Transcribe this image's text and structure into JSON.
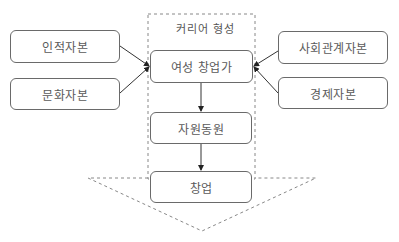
{
  "diagram": {
    "container": {
      "title": "커리어 형성"
    },
    "left_nodes": [
      {
        "label": "인적자본"
      },
      {
        "label": "문화자본"
      }
    ],
    "center_nodes": [
      {
        "label": "여성 창업가"
      },
      {
        "label": "자원동원"
      },
      {
        "label": "창업"
      }
    ],
    "right_nodes": [
      {
        "label": "사회관계자본"
      },
      {
        "label": "경제자본"
      }
    ],
    "edges": [
      {
        "from": "인적자본",
        "to": "여성 창업가"
      },
      {
        "from": "문화자본",
        "to": "여성 창업가"
      },
      {
        "from": "사회관계자본",
        "to": "여성 창업가"
      },
      {
        "from": "경제자본",
        "to": "여성 창업가"
      },
      {
        "from": "여성 창업가",
        "to": "자원동원"
      },
      {
        "from": "자원동원",
        "to": "창업"
      }
    ],
    "colors": {
      "line": "#333333",
      "border": "#6a6a6a",
      "dashed": "#888888"
    }
  }
}
